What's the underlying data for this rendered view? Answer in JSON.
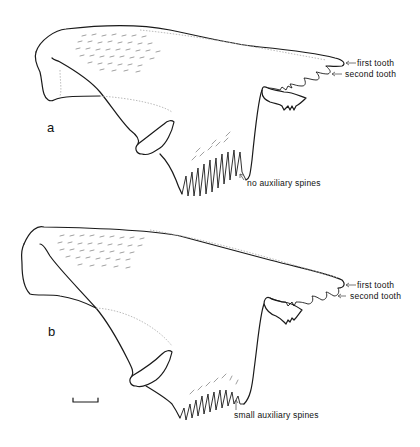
{
  "figure": {
    "panels": [
      {
        "id": "a",
        "label": "a",
        "annotations": {
          "first_tooth": "first tooth",
          "second_tooth": "second tooth",
          "spines": "no auxiliary spines"
        }
      },
      {
        "id": "b",
        "label": "b",
        "annotations": {
          "first_tooth": "first tooth",
          "second_tooth": "second tooth",
          "spines": "small auxiliary spines"
        }
      }
    ],
    "scale_bar": "scale-bar"
  },
  "colors": {
    "line": "#1a1a1a",
    "background": "#ffffff"
  }
}
